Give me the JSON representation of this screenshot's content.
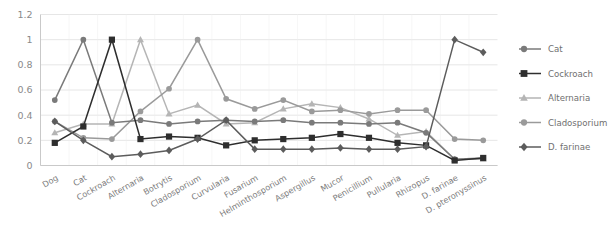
{
  "chart_data": {
    "type": "line",
    "title": "",
    "subtitle": "",
    "xlabel": "",
    "ylabel": "",
    "ylim": [
      0,
      1.2
    ],
    "y_ticks": [
      "0",
      "0.2",
      "0.4",
      "0.6",
      "0.8",
      "1",
      "1.2"
    ],
    "y_tick_values": [
      0,
      0.2,
      0.4,
      0.6,
      0.8,
      1.0,
      1.2
    ],
    "grid": true,
    "legend_position": "right",
    "categories": [
      "Dog",
      "Cat",
      "Cockroach",
      "Alternaria",
      "Botrytis",
      "Cladosporium",
      "Curvularia",
      "Fusarium",
      "Helminthosporium",
      "Aspergillus",
      "Mucor",
      "Penicillium",
      "Pullularia",
      "Rhizopus",
      "D. farinae",
      "D. pteronyssinus"
    ],
    "series": [
      {
        "name": "Cat",
        "color": "#7a7a7a",
        "marker": "circle",
        "values": [
          0.52,
          1.0,
          0.34,
          0.36,
          0.33,
          0.35,
          0.36,
          0.35,
          0.36,
          0.34,
          0.34,
          0.33,
          0.34,
          0.26,
          0.05,
          0.06
        ]
      },
      {
        "name": "Cockroach",
        "color": "#2e2e2e",
        "marker": "square",
        "values": [
          0.18,
          0.31,
          1.0,
          0.21,
          0.23,
          0.22,
          0.16,
          0.2,
          0.21,
          0.22,
          0.25,
          0.22,
          0.18,
          0.16,
          0.04,
          0.06
        ]
      },
      {
        "name": "Alternaria",
        "color": "#b5b5b5",
        "marker": "triangle",
        "values": [
          0.26,
          0.33,
          0.33,
          1.0,
          0.41,
          0.48,
          0.33,
          0.34,
          0.45,
          0.49,
          0.46,
          0.37,
          0.24,
          0.27,
          0.05,
          0.05
        ]
      },
      {
        "name": "Cladosporium",
        "color": "#9a9a9a",
        "marker": "circle",
        "values": [
          0.35,
          0.22,
          0.21,
          0.43,
          0.61,
          1.0,
          0.53,
          0.45,
          0.52,
          0.43,
          0.44,
          0.41,
          0.44,
          0.44,
          0.21,
          0.2
        ]
      },
      {
        "name": "D. farinae",
        "color": "#5c5c5c",
        "marker": "diamond",
        "values": [
          0.35,
          0.2,
          0.07,
          0.09,
          0.12,
          0.21,
          0.36,
          0.13,
          0.13,
          0.13,
          0.14,
          0.13,
          0.13,
          0.15,
          1.0,
          0.9
        ]
      }
    ],
    "legend_entries": [
      {
        "label": "Cat",
        "color": "#7a7a7a",
        "marker": "circle"
      },
      {
        "label": "Cockroach",
        "color": "#2e2e2e",
        "marker": "square"
      },
      {
        "label": "Alternaria",
        "color": "#b5b5b5",
        "marker": "triangle"
      },
      {
        "label": "Cladosporium",
        "color": "#9a9a9a",
        "marker": "circle"
      },
      {
        "label": "D. farinae",
        "color": "#5c5c5c",
        "marker": "diamond"
      }
    ]
  }
}
